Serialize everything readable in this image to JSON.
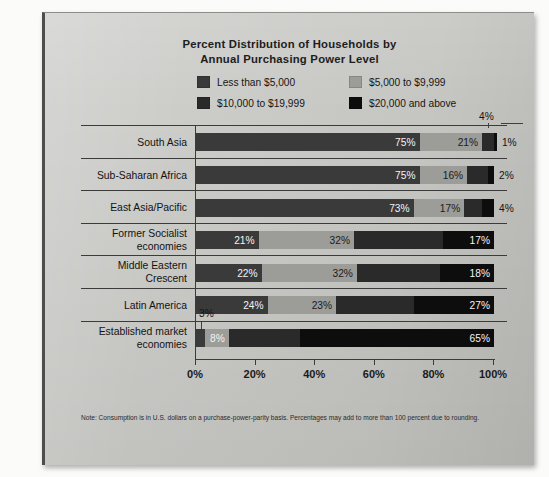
{
  "chart_data": {
    "type": "bar",
    "subtype": "stacked-horizontal-100",
    "title": "Percent Distribution of Households by Annual Purchasing Power Level",
    "title_line1": "Percent Distribution of Households by",
    "title_line2": "Annual Purchasing Power Level",
    "xlabel": "",
    "ylabel": "",
    "xlim": [
      0,
      100
    ],
    "grid": false,
    "legend_position": "top-center",
    "axis_tick_labels": [
      "0%",
      "20%",
      "40%",
      "60%",
      "80%",
      "100%"
    ],
    "axis_ticks": [
      0,
      20,
      40,
      60,
      80,
      100
    ],
    "categories": [
      "South Asia",
      "Sub-Saharan Africa",
      "East Asia/Pacific",
      "Former Socialist economies",
      "Middle Eastern Crescent",
      "Latin America",
      "Established market economies"
    ],
    "series": [
      {
        "name": "Less than $5,000",
        "color": "#3a3a3a",
        "values": [
          75,
          75,
          73,
          21,
          22,
          24,
          3
        ]
      },
      {
        "name": "$5,000 to $9,999",
        "color": "#9c9c99",
        "values": [
          21,
          16,
          17,
          32,
          32,
          23,
          8
        ]
      },
      {
        "name": "$10,000 to $19,999",
        "color": "#2a2a2a",
        "values": [
          4,
          7,
          6,
          30,
          28,
          26,
          24
        ]
      },
      {
        "name": "$20,000 and above",
        "color": "#0d0d0d",
        "values": [
          1,
          2,
          4,
          17,
          18,
          27,
          65
        ]
      }
    ],
    "note": "Note: Consumption is in U.S. dollars on a purchase-power-parity basis. Percentages may add to more than 100 percent due to rounding."
  },
  "title": {
    "line1": "Percent Distribution of Households by",
    "line2": "Annual Purchasing Power Level"
  },
  "legend": {
    "items": [
      {
        "label": "Less than $5,000",
        "color": "#3a3a3a"
      },
      {
        "label": "$5,000 to $9,999",
        "color": "#9c9c99"
      },
      {
        "label": "$10,000 to $19,999",
        "color": "#2a2a2a"
      },
      {
        "label": "$20,000 and above",
        "color": "#0d0d0d"
      }
    ]
  },
  "rows": [
    {
      "label": "South Asia",
      "label_line1": "South Asia",
      "label_line2": "",
      "segments": [
        {
          "series": "Less than $5,000",
          "value": 75,
          "label": "75%",
          "label_style": "light",
          "placement": "inside"
        },
        {
          "series": "$5,000 to $9,999",
          "value": 21,
          "label": "21%",
          "label_style": "dark",
          "placement": "inside"
        },
        {
          "series": "$10,000 to $19,999",
          "value": 4,
          "label": "4%",
          "label_style": "light",
          "placement": "callout"
        },
        {
          "series": "$20,000 and above",
          "value": 1,
          "label": "1%",
          "label_style": "dark",
          "placement": "outside"
        }
      ]
    },
    {
      "label": "Sub-Saharan Africa",
      "label_line1": "Sub-Saharan Africa",
      "label_line2": "",
      "segments": [
        {
          "series": "Less than $5,000",
          "value": 75,
          "label": "75%",
          "label_style": "light",
          "placement": "inside"
        },
        {
          "series": "$5,000 to $9,999",
          "value": 16,
          "label": "16%",
          "label_style": "dark",
          "placement": "inside"
        },
        {
          "series": "$10,000 to $19,999",
          "value": 7,
          "label": "",
          "label_style": "light",
          "placement": "none"
        },
        {
          "series": "$20,000 and above",
          "value": 2,
          "label": "2%",
          "label_style": "dark",
          "placement": "outside"
        }
      ]
    },
    {
      "label": "East Asia/Pacific",
      "label_line1": "East Asia/Pacific",
      "label_line2": "",
      "segments": [
        {
          "series": "Less than $5,000",
          "value": 73,
          "label": "73%",
          "label_style": "light",
          "placement": "inside"
        },
        {
          "series": "$5,000 to $9,999",
          "value": 17,
          "label": "17%",
          "label_style": "dark",
          "placement": "inside"
        },
        {
          "series": "$10,000 to $19,999",
          "value": 6,
          "label": "",
          "label_style": "light",
          "placement": "none"
        },
        {
          "series": "$20,000 and above",
          "value": 4,
          "label": "4%",
          "label_style": "dark",
          "placement": "outside"
        }
      ]
    },
    {
      "label": "Former Socialist economies",
      "label_line1": "Former Socialist",
      "label_line2": "economies",
      "segments": [
        {
          "series": "Less than $5,000",
          "value": 21,
          "label": "21%",
          "label_style": "light",
          "placement": "inside"
        },
        {
          "series": "$5,000 to $9,999",
          "value": 32,
          "label": "32%",
          "label_style": "dark",
          "placement": "inside"
        },
        {
          "series": "$10,000 to $19,999",
          "value": 30,
          "label": "",
          "label_style": "light",
          "placement": "none"
        },
        {
          "series": "$20,000 and above",
          "value": 17,
          "label": "17%",
          "label_style": "light",
          "placement": "inside"
        }
      ]
    },
    {
      "label": "Middle Eastern Crescent",
      "label_line1": "Middle Eastern",
      "label_line2": "Crescent",
      "segments": [
        {
          "series": "Less than $5,000",
          "value": 22,
          "label": "22%",
          "label_style": "light",
          "placement": "inside"
        },
        {
          "series": "$5,000 to $9,999",
          "value": 32,
          "label": "32%",
          "label_style": "dark",
          "placement": "inside"
        },
        {
          "series": "$10,000 to $19,999",
          "value": 28,
          "label": "",
          "label_style": "light",
          "placement": "none"
        },
        {
          "series": "$20,000 and above",
          "value": 18,
          "label": "18%",
          "label_style": "light",
          "placement": "inside"
        }
      ]
    },
    {
      "label": "Latin America",
      "label_line1": "Latin America",
      "label_line2": "",
      "segments": [
        {
          "series": "Less than $5,000",
          "value": 24,
          "label": "24%",
          "label_style": "light",
          "placement": "inside"
        },
        {
          "series": "$5,000 to $9,999",
          "value": 23,
          "label": "23%",
          "label_style": "dark",
          "placement": "inside"
        },
        {
          "series": "$10,000 to $19,999",
          "value": 26,
          "label": "",
          "label_style": "light",
          "placement": "none"
        },
        {
          "series": "$20,000 and above",
          "value": 27,
          "label": "27%",
          "label_style": "light",
          "placement": "inside"
        }
      ]
    },
    {
      "label": "Established market economies",
      "label_line1": "Established market",
      "label_line2": "economies",
      "segments": [
        {
          "series": "Less than $5,000",
          "value": 3,
          "label": "3%",
          "label_style": "dark",
          "placement": "callout"
        },
        {
          "series": "$5,000 to $9,999",
          "value": 8,
          "label": "8%",
          "label_style": "light",
          "placement": "inside"
        },
        {
          "series": "$10,000 to $19,999",
          "value": 24,
          "label": "",
          "label_style": "light",
          "placement": "none"
        },
        {
          "series": "$20,000 and above",
          "value": 65,
          "label": "65%",
          "label_style": "light",
          "placement": "inside"
        }
      ]
    }
  ],
  "axis": {
    "ticks": [
      "0%",
      "20%",
      "40%",
      "60%",
      "80%",
      "100%"
    ]
  },
  "note": {
    "text": "Note: Consumption is in U.S. dollars on a purchase-power-parity basis. Percentages may add to more than 100 percent due to rounding."
  }
}
